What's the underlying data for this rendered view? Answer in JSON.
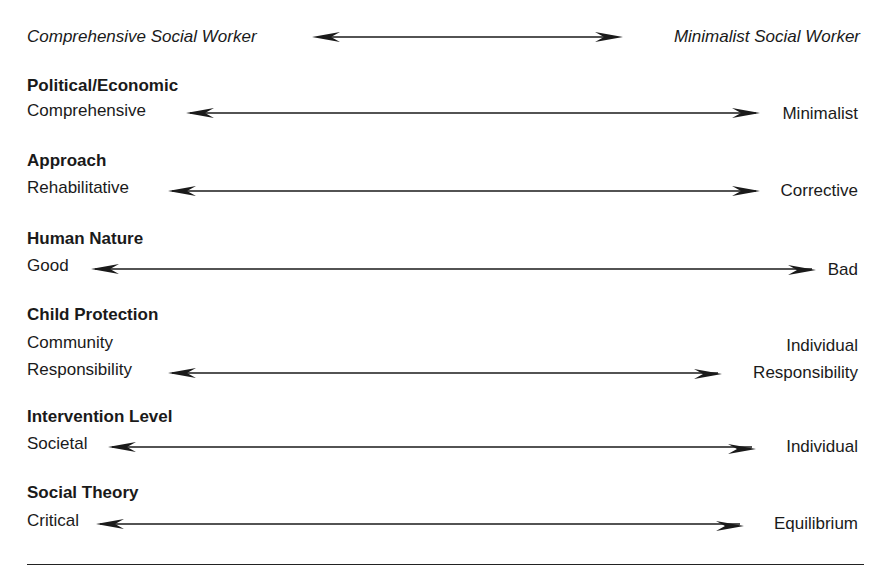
{
  "header": {
    "left_label": "Comprehensive Social Worker",
    "right_label": "Minimalist Social Worker"
  },
  "dimensions": [
    {
      "heading": "Political/Economic",
      "left": [
        "Comprehensive"
      ],
      "right": [
        "Minimalist"
      ]
    },
    {
      "heading": "Approach",
      "left": [
        "Rehabilitative"
      ],
      "right": [
        "Corrective"
      ]
    },
    {
      "heading": "Human Nature",
      "left": [
        "Good"
      ],
      "right": [
        "Bad"
      ]
    },
    {
      "heading": "Child Protection",
      "left": [
        "Community",
        "Responsibility"
      ],
      "right": [
        "Individual",
        "Responsibility"
      ]
    },
    {
      "heading": "Intervention Level",
      "left": [
        "Societal"
      ],
      "right": [
        "Individual"
      ]
    },
    {
      "heading": "Social Theory",
      "left": [
        "Critical"
      ],
      "right": [
        "Equilibrium"
      ]
    }
  ],
  "colors": {
    "text": "#1a1a1a",
    "arrow": "#1a1a1a",
    "background": "#ffffff"
  }
}
